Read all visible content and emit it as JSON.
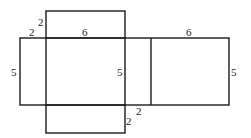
{
  "diagram": {
    "stroke_color": "#1a1a1a",
    "labels": {
      "top_flap_height": "2",
      "left_flap_width": "2",
      "top_length": "6",
      "left_height": "5",
      "middle_height": "5",
      "right_top_length": "6",
      "right_height": "5",
      "bottom_flap_height": "2",
      "bottom_flap_width": "2"
    }
  }
}
